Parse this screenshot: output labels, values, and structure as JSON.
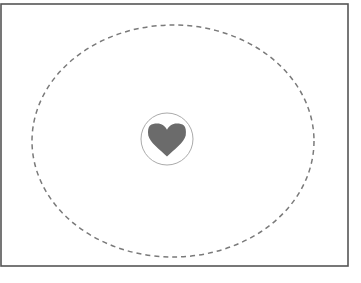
{
  "canvas": {
    "width": 361,
    "height": 283,
    "background": "#ffffff"
  },
  "diagram": {
    "type": "nested-region-diagram",
    "title": "",
    "frame": {
      "label": "outer-frame",
      "shape": "rectangle",
      "x": 1,
      "y": 4,
      "width": 347,
      "height": 262,
      "stroke": "#555555",
      "stroke_width": 1.6,
      "fill": "none",
      "left_edge_visible": false
    },
    "boundary": {
      "label": "dashed-boundary",
      "shape": "ellipse",
      "cx": 173,
      "cy": 141,
      "rx": 141,
      "ry": 116,
      "stroke": "#7a7a7a",
      "stroke_width": 1.5,
      "dash": "5 4",
      "fill": "none"
    },
    "inner": {
      "label": "inner-circle",
      "shape": "circle",
      "cx": 167,
      "cy": 139,
      "r": 26,
      "stroke": "#a0a0a0",
      "stroke_width": 0.9,
      "fill": "none"
    },
    "symbol": {
      "label": "heart-symbol",
      "shape": "heart",
      "cx": 167,
      "cy": 140,
      "width": 39,
      "height": 33,
      "fill": "#6b6b6b",
      "stroke": "none"
    }
  }
}
